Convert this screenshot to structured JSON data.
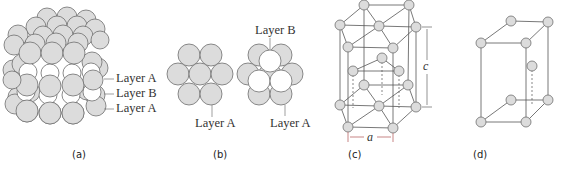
{
  "figure": {
    "colors": {
      "atom_fill": "#dcdcdc",
      "atom_stroke": "#777777",
      "open_atom_fill": "#ffffff",
      "line": "#555555",
      "dimension_line": "#b05050",
      "text": "#333333"
    },
    "panels": [
      {
        "id": "a",
        "caption": "(a)",
        "labels": [
          "Layer A",
          "Layer B",
          "Layer A"
        ]
      },
      {
        "id": "b",
        "caption": "(b)",
        "labels": {
          "left_layer": "Layer A",
          "top_layer": "Layer B",
          "right_layer": "Layer A"
        }
      },
      {
        "id": "c",
        "caption": "(c)",
        "dimensions": {
          "height": "c",
          "width": "a"
        }
      },
      {
        "id": "d",
        "caption": "(d)"
      }
    ]
  }
}
